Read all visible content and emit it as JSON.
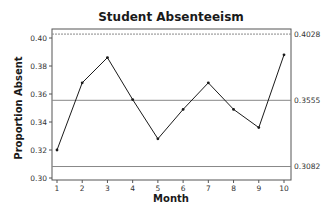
{
  "chart_data": {
    "type": "line",
    "title": "Student Absenteeism",
    "xlabel": "Month",
    "ylabel": "Proportion Absent",
    "x": [
      1,
      2,
      3,
      4,
      5,
      6,
      7,
      8,
      9,
      10
    ],
    "series": [
      {
        "name": "Proportion Absent",
        "values": [
          0.32,
          0.368,
          0.386,
          0.356,
          0.328,
          0.349,
          0.368,
          0.349,
          0.336,
          0.388
        ]
      }
    ],
    "ylim": [
      0.3,
      0.405
    ],
    "yticks": [
      "0.30",
      "0.32",
      "0.34",
      "0.36",
      "0.38",
      "0.40"
    ],
    "xticks": [
      "1",
      "2",
      "3",
      "4",
      "5",
      "6",
      "7",
      "8",
      "9",
      "10"
    ],
    "reference_lines": [
      {
        "name": "UCL",
        "value": 0.4028,
        "label": "0.4028",
        "style": "dashed"
      },
      {
        "name": "Center",
        "value": 0.3555,
        "label": "0.3555",
        "style": "solid"
      },
      {
        "name": "LCL",
        "value": 0.3082,
        "label": "0.3082",
        "style": "solid"
      }
    ],
    "grid": false,
    "legend": "none"
  },
  "colors": {
    "line": "#1a1a1a",
    "frame": "#555555",
    "reference": "#888888"
  }
}
